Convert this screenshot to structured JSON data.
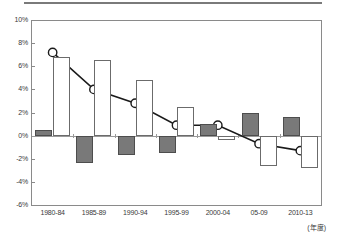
{
  "chart_data": {
    "type": "bar",
    "title": "",
    "xlabel": "(年度)",
    "ylabel": "",
    "ylim": [
      -6,
      10
    ],
    "ytick_step": 2,
    "ytick_labels": [
      "10%",
      "8%",
      "6%",
      "4%",
      "2%",
      "0%",
      "-2%",
      "-4%",
      "-6%"
    ],
    "ytick_values": [
      10,
      8,
      6,
      4,
      2,
      0,
      -2,
      -4,
      -6
    ],
    "grid": false,
    "legend": "none",
    "categories": [
      "1980-84",
      "1985-89",
      "1990-94",
      "1995-99",
      "2000-04",
      "05-09",
      "2010-13"
    ],
    "series": [
      {
        "name": "gray-bar-series",
        "render": "bar",
        "fill": "#797979",
        "stroke": "#4d4d4d",
        "values": [
          0.5,
          -2.4,
          -1.7,
          -1.5,
          1.0,
          2.0,
          1.6
        ]
      },
      {
        "name": "white-bar-series",
        "render": "bar",
        "fill": "#ffffff",
        "stroke": "#6b6b6b",
        "values": [
          6.8,
          6.5,
          4.8,
          2.5,
          -0.4,
          -2.6,
          -2.8
        ]
      },
      {
        "name": "line-series",
        "render": "line-marker",
        "stroke": "#1a1a1a",
        "marker": "open-circle",
        "values": [
          7.2,
          4.0,
          2.8,
          0.9,
          0.9,
          -0.7,
          -1.3
        ]
      }
    ]
  },
  "axis": {
    "unit_label": "(年度)"
  }
}
